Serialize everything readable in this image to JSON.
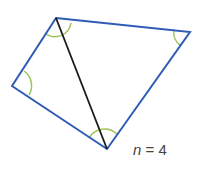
{
  "diagram": {
    "type": "quadrilateral-split-into-triangles",
    "vertices": {
      "top": [
        56,
        18
      ],
      "right": [
        190,
        32
      ],
      "bottom": [
        107,
        149
      ],
      "left": [
        12,
        86
      ]
    },
    "diagonal": [
      "top",
      "bottom"
    ],
    "colors": {
      "edge": "#2f5bb7",
      "diagonal": "#1a1a1a",
      "angle_arc": "#9bc45a"
    },
    "label": {
      "variable": "n",
      "equals": "=",
      "value": "4"
    }
  }
}
